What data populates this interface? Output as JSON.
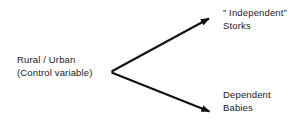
{
  "diagram": {
    "type": "causal-path-diagram",
    "background_color": "#ffffff",
    "stroke_color": "#111111",
    "text_color": "#1a1a1a",
    "nodes": {
      "control": {
        "id": "control-variable",
        "line1": "Rural / Urban",
        "line2": "(Control variable)"
      },
      "independent": {
        "id": "independent-storks",
        "line1": "” Independent”",
        "line2": "Storks"
      },
      "dependent": {
        "id": "dependent-babies",
        "line1": "Dependent",
        "line2": "Babies"
      }
    },
    "arrows": [
      {
        "id": "arrow-to-independent",
        "from": "control-variable",
        "to": "independent-storks",
        "direction": "up-right"
      },
      {
        "id": "arrow-to-dependent",
        "from": "control-variable",
        "to": "dependent-babies",
        "direction": "down-right"
      }
    ]
  }
}
